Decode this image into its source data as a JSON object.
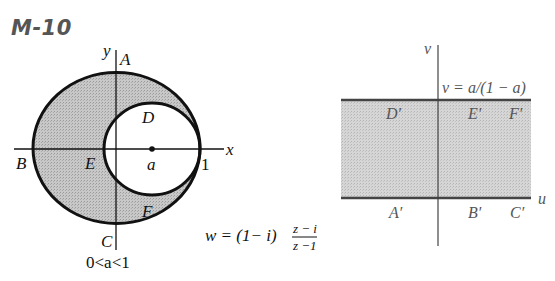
{
  "title": "M-10",
  "colors": {
    "shade": "#c4c4c4",
    "shade_right": "#d2d2d2",
    "stroke": "#111111",
    "right_stroke": "#444444",
    "right_text": "#555555"
  },
  "z_plane": {
    "axis_labels": {
      "x": "x",
      "y": "y"
    },
    "points": {
      "A": "A",
      "B": "B",
      "C": "C",
      "D": "D",
      "E": "E",
      "F": "F",
      "a": "a",
      "one": "1"
    },
    "condition": "0<a<1",
    "outer_circle": {
      "cx": 116.5,
      "cy": 148,
      "rx": 83.5,
      "ry": 75.5
    },
    "inner_circle": {
      "cx": 152,
      "cy": 149,
      "rx": 48,
      "ry": 46
    }
  },
  "mapping": {
    "lhs": "w = (1− i)",
    "numerator": "z − i",
    "denominator": "z −1"
  },
  "w_plane": {
    "axis_labels": {
      "u": "u",
      "v": "v"
    },
    "line_label": "v = a/(1 − a)",
    "points_top": [
      "D′",
      "E′",
      "F′"
    ],
    "points_bottom": [
      "A′",
      "B′",
      "C′"
    ]
  }
}
